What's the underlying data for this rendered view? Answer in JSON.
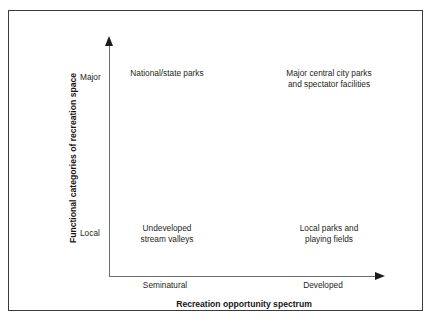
{
  "figure": {
    "background_color": "#ffffff",
    "border_color": "#3a3a3a",
    "axis_color": "#6e6e6e",
    "text_color": "#231f20"
  },
  "axes": {
    "x_title": "Recreation opportunity spectrum",
    "y_title": "Functional categories of recreation space",
    "x_ticks": [
      "Seminatural",
      "Developed"
    ],
    "y_ticks": [
      "Major",
      "Local"
    ]
  },
  "quadrants": {
    "top_left": {
      "line1": "National/state parks",
      "line2": ""
    },
    "top_right": {
      "line1": "Major central city parks",
      "line2": "and spectator facilities"
    },
    "bottom_left": {
      "line1": "Undeveloped",
      "line2": "stream valleys"
    },
    "bottom_right": {
      "line1": "Local parks and",
      "line2": "playing fields"
    }
  },
  "chart_data": {
    "type": "scatter",
    "title": "",
    "xlabel": "Recreation opportunity spectrum",
    "ylabel": "Functional categories of recreation space",
    "x_categories": [
      "Seminatural",
      "Developed"
    ],
    "y_categories": [
      "Local",
      "Major"
    ],
    "grid": false,
    "legend": "none",
    "cells": [
      {
        "x": "Seminatural",
        "y": "Major",
        "label": "National/state parks"
      },
      {
        "x": "Developed",
        "y": "Major",
        "label": "Major central city parks and spectator facilities"
      },
      {
        "x": "Seminatural",
        "y": "Local",
        "label": "Undeveloped stream valleys"
      },
      {
        "x": "Developed",
        "y": "Local",
        "label": "Local parks and playing fields"
      }
    ]
  }
}
